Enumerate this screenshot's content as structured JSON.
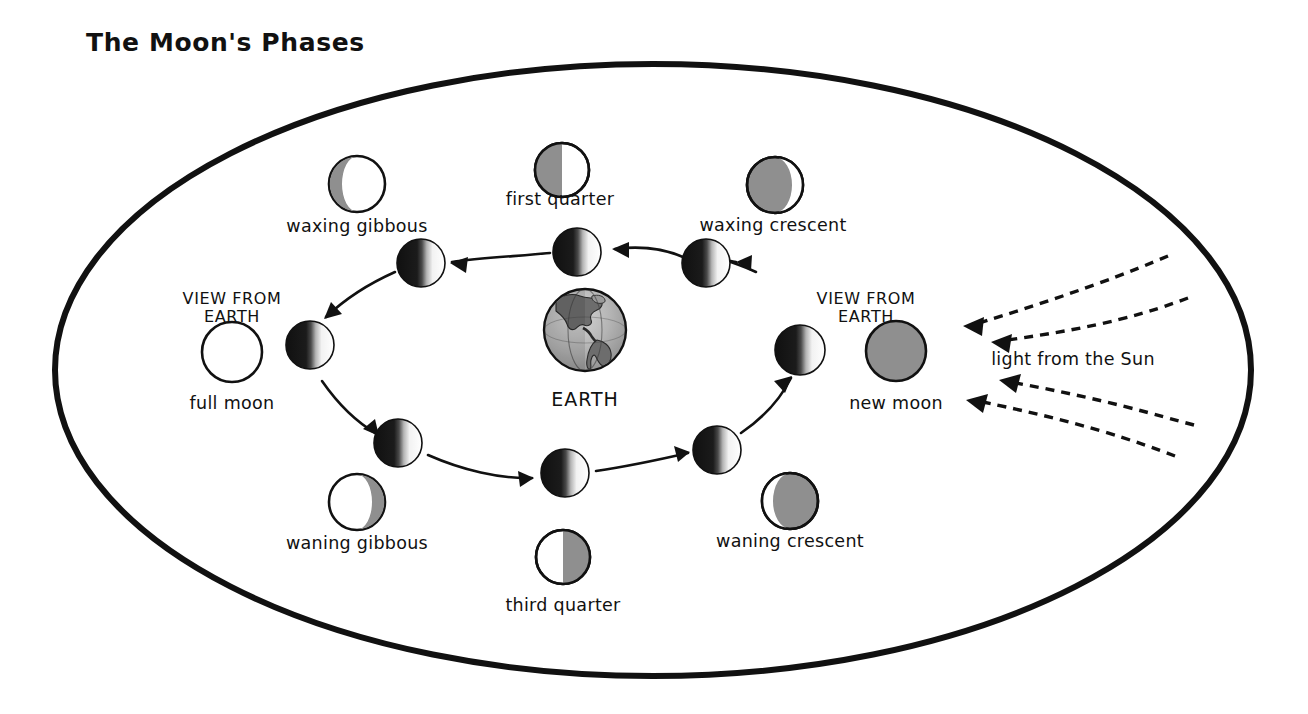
{
  "title": "The Moon's Phases",
  "colors": {
    "outline": "#111111",
    "shadow_gray": "#8f8f8f",
    "lit_white": "#ffffff",
    "dark_black": "#171717",
    "background": "#ffffff"
  },
  "center_body": {
    "label": "EARTH",
    "cx": 585,
    "cy": 330,
    "r": 41
  },
  "sun_light": {
    "label": "light from the Sun",
    "label_x": 1073,
    "label_y": 365,
    "arrow_count": 4,
    "direction": "leftward"
  },
  "view_labels": [
    {
      "name": "view-from-earth-left",
      "line1": "VIEW FROM",
      "line2": "EARTH",
      "x": 232,
      "y": 304
    },
    {
      "name": "view-from-earth-right",
      "line1": "VIEW FROM",
      "line2": "EARTH",
      "x": 866,
      "y": 304
    }
  ],
  "phase_views": [
    {
      "id": "waxing-gibbous",
      "label": "waxing gibbous",
      "cx": 357,
      "cy": 184,
      "r": 28,
      "label_x": 357,
      "label_y": 232,
      "appearance": "mostly-lit-shadow-left",
      "lit_fraction": 0.78,
      "shadow_side": "left"
    },
    {
      "id": "first-quarter",
      "label": "first quarter",
      "cx": 562,
      "cy": 170,
      "r": 27,
      "label_x": 560,
      "label_y": 205,
      "appearance": "half-shadow-left",
      "lit_fraction": 0.5,
      "shadow_side": "left"
    },
    {
      "id": "waxing-crescent",
      "label": "waxing crescent",
      "cx": 775,
      "cy": 185,
      "r": 28,
      "label_x": 773,
      "label_y": 231,
      "appearance": "crescent-lit-right",
      "lit_fraction": 0.14,
      "shadow_side": "left"
    },
    {
      "id": "full-moon",
      "label": "full moon",
      "cx": 232,
      "cy": 352,
      "r": 30,
      "label_x": 232,
      "label_y": 409,
      "appearance": "fully-lit",
      "lit_fraction": 1.0,
      "shadow_side": "none"
    },
    {
      "id": "new-moon",
      "label": "new moon",
      "cx": 896,
      "cy": 351,
      "r": 30,
      "label_x": 896,
      "label_y": 409,
      "appearance": "fully-shadowed",
      "lit_fraction": 0.0,
      "shadow_side": "all"
    },
    {
      "id": "waning-gibbous",
      "label": "waning gibbous",
      "cx": 357,
      "cy": 502,
      "r": 28,
      "label_x": 357,
      "label_y": 549,
      "appearance": "mostly-lit-shadow-right",
      "lit_fraction": 0.78,
      "shadow_side": "right"
    },
    {
      "id": "waning-crescent",
      "label": "waning crescent",
      "cx": 790,
      "cy": 501,
      "r": 28,
      "label_x": 790,
      "label_y": 547,
      "appearance": "crescent-lit-left",
      "lit_fraction": 0.14,
      "shadow_side": "right"
    },
    {
      "id": "third-quarter",
      "label": "third quarter",
      "cx": 563,
      "cy": 557,
      "r": 27,
      "label_x": 563,
      "label_y": 611,
      "appearance": "half-shadow-right",
      "lit_fraction": 0.5,
      "shadow_side": "right"
    }
  ],
  "orbit_moons": [
    {
      "id": "orbit-moon-waxing-gibbous",
      "cx": 421,
      "cy": 263,
      "r": 24
    },
    {
      "id": "orbit-moon-first-quarter",
      "cx": 577,
      "cy": 252,
      "r": 24
    },
    {
      "id": "orbit-moon-waxing-crescent",
      "cx": 706,
      "cy": 263,
      "r": 24
    },
    {
      "id": "orbit-moon-full",
      "cx": 310,
      "cy": 345,
      "r": 24
    },
    {
      "id": "orbit-moon-new",
      "cx": 800,
      "cy": 350,
      "r": 25
    },
    {
      "id": "orbit-moon-waning-gibbous",
      "cx": 398,
      "cy": 443,
      "r": 24
    },
    {
      "id": "orbit-moon-third-quarter",
      "cx": 565,
      "cy": 473,
      "r": 24
    },
    {
      "id": "orbit-moon-waning-crescent",
      "cx": 717,
      "cy": 450,
      "r": 24
    }
  ],
  "boundary_ellipse": {
    "cx": 653,
    "cy": 370,
    "rx": 598,
    "ry": 306,
    "stroke_width": 6
  },
  "orbit_direction": "counterclockwise"
}
